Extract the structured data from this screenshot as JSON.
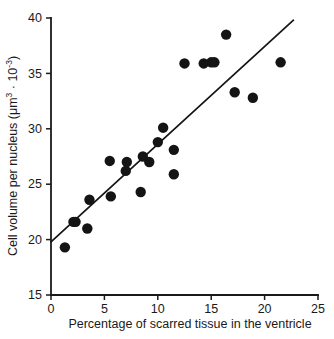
{
  "chart_data": {
    "type": "scatter",
    "title": "",
    "xlabel": "Percentage of scarred tissue in the ventricle",
    "ylabel": "Cell volume per nucleus (μm³ · 10⁻³)",
    "ylabel_parts": {
      "main": "Cell volume per nucleus (μm",
      "sup1": "3",
      "mid": " · 10",
      "sup2": "-3",
      "tail": ")"
    },
    "xlim": [
      0,
      25
    ],
    "ylim": [
      15,
      40
    ],
    "xticks": [
      0,
      5,
      10,
      15,
      20,
      25
    ],
    "yticks": [
      15,
      20,
      25,
      30,
      35,
      40
    ],
    "xtick_labels": [
      "0",
      "5",
      "10",
      "15",
      "20",
      "25"
    ],
    "ytick_labels": [
      "15",
      "20",
      "25",
      "30",
      "35",
      "40"
    ],
    "grid": false,
    "legend": null,
    "marker": "filled-circle",
    "marker_color": "#141414",
    "marker_size": 5.2,
    "points": [
      {
        "x": 1.3,
        "y": 19.3
      },
      {
        "x": 2.1,
        "y": 21.6
      },
      {
        "x": 2.3,
        "y": 21.6
      },
      {
        "x": 3.4,
        "y": 21.0
      },
      {
        "x": 3.6,
        "y": 23.6
      },
      {
        "x": 5.5,
        "y": 27.1
      },
      {
        "x": 5.6,
        "y": 23.9
      },
      {
        "x": 7.0,
        "y": 26.2
      },
      {
        "x": 7.1,
        "y": 27.0
      },
      {
        "x": 8.4,
        "y": 24.3
      },
      {
        "x": 8.6,
        "y": 27.5
      },
      {
        "x": 9.2,
        "y": 27.0
      },
      {
        "x": 10.0,
        "y": 28.8
      },
      {
        "x": 10.5,
        "y": 30.1
      },
      {
        "x": 11.5,
        "y": 28.1
      },
      {
        "x": 11.5,
        "y": 25.9
      },
      {
        "x": 12.5,
        "y": 35.9
      },
      {
        "x": 14.3,
        "y": 35.9
      },
      {
        "x": 15.0,
        "y": 36.0
      },
      {
        "x": 15.3,
        "y": 36.0
      },
      {
        "x": 16.4,
        "y": 38.5
      },
      {
        "x": 17.2,
        "y": 33.3
      },
      {
        "x": 18.9,
        "y": 32.8
      },
      {
        "x": 21.5,
        "y": 36.0
      }
    ],
    "fit_line": {
      "type": "linear-regression",
      "x_start": 0.0,
      "y_start": 19.8,
      "x_end": 22.7,
      "y_end": 39.8,
      "color": "#141414"
    }
  }
}
